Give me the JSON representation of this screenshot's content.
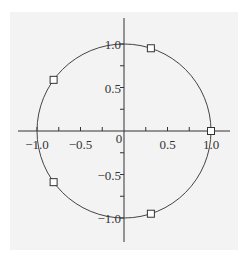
{
  "chart_data": {
    "type": "scatter",
    "title": "",
    "xlabel": "",
    "ylabel": "",
    "xlim": [
      -1.2,
      1.2
    ],
    "ylim": [
      -1.25,
      1.25
    ],
    "grid": false,
    "background": "#f3f3f3",
    "curve": {
      "shape": "unit-circle",
      "center": [
        0,
        0
      ],
      "radius": 1.0
    },
    "points": [
      {
        "x": 1.0,
        "y": 0.0
      },
      {
        "x": 0.309,
        "y": 0.951
      },
      {
        "x": -0.809,
        "y": 0.588
      },
      {
        "x": -0.809,
        "y": -0.588
      },
      {
        "x": 0.309,
        "y": -0.951
      }
    ],
    "marker": "open-square",
    "x_ticks": [
      {
        "value": -1.0,
        "label": "−1.0"
      },
      {
        "value": -0.5,
        "label": "−0.5"
      },
      {
        "value": 0,
        "label": "0"
      },
      {
        "value": 0.5,
        "label": "0.5"
      },
      {
        "value": 1.0,
        "label": "1.0"
      }
    ],
    "y_ticks": [
      {
        "value": 1.0,
        "label": "1.0"
      },
      {
        "value": 0.5,
        "label": "0.5"
      },
      {
        "value": -0.5,
        "label": "−0.5"
      },
      {
        "value": -1.0,
        "label": "−1.0"
      }
    ]
  }
}
